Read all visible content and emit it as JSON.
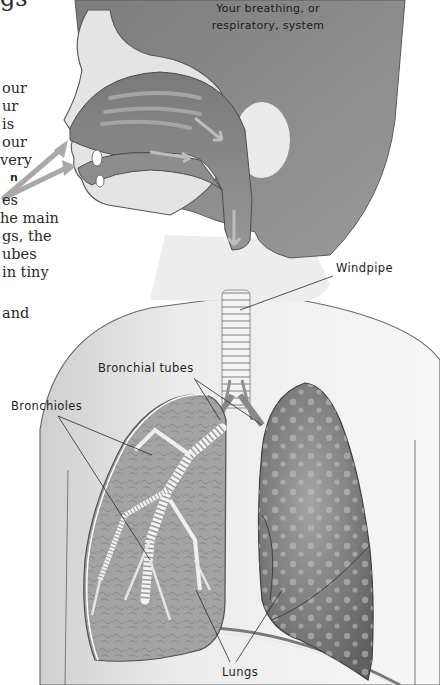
{
  "diagram": {
    "title": [
      "Your breathing, or",
      "respiratory, system"
    ],
    "labels": {
      "windpipe": "Windpipe",
      "bronchial_tubes": "Bronchial tubes",
      "bronchioles": "Bronchioles",
      "lungs": "Lungs"
    },
    "body_text_fragments": [
      "our",
      "ur",
      "is",
      "our",
      "very",
      "n",
      "es",
      "he main",
      "gs, the",
      "ubes",
      "in tiny",
      "and"
    ],
    "heading_fragment": "gs",
    "colors": {
      "head_shadow": "#8d8d8d",
      "skin": "#e6e6e6",
      "airway": "#8a8a8a",
      "lung_left": "#9e9e9e",
      "lung_right": "#6e6e6e",
      "cartilage": "#f2f2f2",
      "background": "#ffffff"
    }
  }
}
